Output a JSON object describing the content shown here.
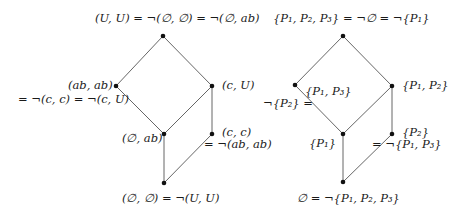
{
  "diagrams": [
    {
      "name": "lattice-pairs",
      "nodes": [
        {
          "id": "top",
          "x": 163,
          "y": 36,
          "label": "(U, U) = ¬(∅, ∅) = ¬(∅, ab)"
        },
        {
          "id": "left",
          "x": 116,
          "y": 86,
          "label": "(ab, ab)",
          "label2": "= ¬(c, c) = ¬(c, U)"
        },
        {
          "id": "right",
          "x": 212,
          "y": 86,
          "label": "(c, U)"
        },
        {
          "id": "mid",
          "x": 164,
          "y": 134,
          "label": "(∅, ab)"
        },
        {
          "id": "rightlow",
          "x": 212,
          "y": 134,
          "label": "(c, c)",
          "label2": "= ¬(ab, ab)"
        },
        {
          "id": "bottom",
          "x": 164,
          "y": 183,
          "label": "(∅, ∅) = ¬(U, U)"
        }
      ],
      "edges": [
        [
          "top",
          "left"
        ],
        [
          "top",
          "right"
        ],
        [
          "left",
          "mid"
        ],
        [
          "right",
          "mid"
        ],
        [
          "right",
          "rightlow"
        ],
        [
          "mid",
          "bottom"
        ],
        [
          "rightlow",
          "bottom"
        ]
      ]
    },
    {
      "name": "lattice-sets",
      "nodes": [
        {
          "id": "top",
          "x": 343,
          "y": 36,
          "label": "{P₁, P₂, P₃} = ¬∅ = ¬{P₁}"
        },
        {
          "id": "left",
          "x": 295,
          "y": 85,
          "label": "{P₁, P₃}",
          "label2": "¬{P₂} ="
        },
        {
          "id": "right",
          "x": 392,
          "y": 86,
          "label": "{P₁, P₂}"
        },
        {
          "id": "mid",
          "x": 343,
          "y": 134,
          "label": "{P₁}"
        },
        {
          "id": "rightlow",
          "x": 392,
          "y": 134,
          "label": "{P₂}",
          "label2": "= ¬{P₁, P₃}"
        },
        {
          "id": "bottom",
          "x": 343,
          "y": 182,
          "label": "∅ = ¬{P₁, P₂, P₃}"
        }
      ],
      "edges": [
        [
          "top",
          "left"
        ],
        [
          "top",
          "right"
        ],
        [
          "left",
          "mid"
        ],
        [
          "right",
          "mid"
        ],
        [
          "right",
          "rightlow"
        ],
        [
          "mid",
          "bottom"
        ],
        [
          "rightlow",
          "bottom"
        ]
      ]
    }
  ]
}
